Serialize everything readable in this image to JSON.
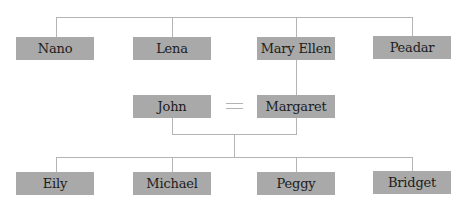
{
  "diagram": {
    "type": "family-tree",
    "colors": {
      "box_fill": "#a9a9a9",
      "line": "#b4b4b4",
      "text": "#1c1c1c"
    },
    "generations": [
      {
        "level": "grandparents-siblings",
        "people": [
          "Nano",
          "Lena",
          "Mary Ellen",
          "Peadar"
        ]
      },
      {
        "level": "parents",
        "people": [
          "John",
          "Margaret"
        ]
      },
      {
        "level": "children",
        "people": [
          "Eily",
          "Michael",
          "Peggy",
          "Bridget"
        ]
      }
    ],
    "relationships": [
      {
        "type": "siblings",
        "members": [
          "Nano",
          "Lena",
          "Mary Ellen",
          "Peadar"
        ]
      },
      {
        "type": "parent-child",
        "parent": "Mary Ellen",
        "child": "Margaret"
      },
      {
        "type": "marriage",
        "symbol": "=",
        "members": [
          "John",
          "Margaret"
        ]
      },
      {
        "type": "parents-of",
        "parents": [
          "John",
          "Margaret"
        ],
        "children": [
          "Eily",
          "Michael",
          "Peggy",
          "Bridget"
        ]
      }
    ]
  }
}
